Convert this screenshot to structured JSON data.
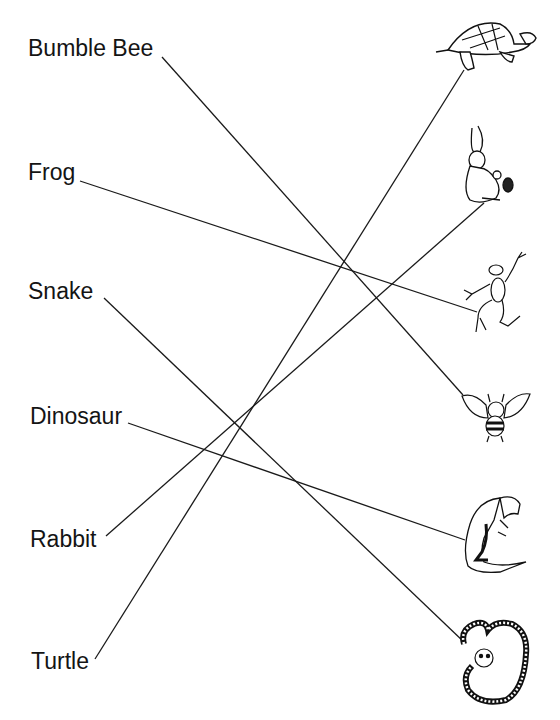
{
  "worksheet": {
    "words": [
      {
        "label": "Bumble Bee",
        "x": 28,
        "y": 37
      },
      {
        "label": "Frog",
        "x": 28,
        "y": 161
      },
      {
        "label": "Snake",
        "x": 28,
        "y": 280
      },
      {
        "label": "Dinosaur",
        "x": 30,
        "y": 405
      },
      {
        "label": "Rabbit",
        "x": 30,
        "y": 528
      },
      {
        "label": "Turtle",
        "x": 31,
        "y": 650
      }
    ],
    "pictures": [
      {
        "animal": "turtle",
        "icon": "turtle-icon"
      },
      {
        "animal": "rabbit",
        "icon": "rabbit-icon"
      },
      {
        "animal": "frog",
        "icon": "frog-icon"
      },
      {
        "animal": "bee",
        "icon": "bee-icon"
      },
      {
        "animal": "dinosaur",
        "icon": "dinosaur-icon"
      },
      {
        "animal": "snake",
        "icon": "snake-icon"
      }
    ],
    "matches": [
      {
        "word": "Bumble Bee",
        "picture": "bee",
        "x1": 162,
        "y1": 57,
        "x2": 463,
        "y2": 395
      },
      {
        "word": "Frog",
        "picture": "frog",
        "x1": 80,
        "y1": 181,
        "x2": 477,
        "y2": 312
      },
      {
        "word": "Snake",
        "picture": "snake",
        "x1": 104,
        "y1": 298,
        "x2": 465,
        "y2": 643
      },
      {
        "word": "Dinosaur",
        "picture": "dinosaur",
        "x1": 128,
        "y1": 423,
        "x2": 465,
        "y2": 540
      },
      {
        "word": "Rabbit",
        "picture": "rabbit",
        "x1": 106,
        "y1": 536,
        "x2": 484,
        "y2": 203
      },
      {
        "word": "Turtle",
        "picture": "turtle",
        "x1": 95,
        "y1": 659,
        "x2": 464,
        "y2": 70
      }
    ],
    "line_color": "#1a1a1a"
  }
}
